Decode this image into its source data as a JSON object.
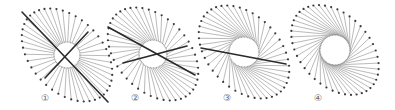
{
  "diagram": {
    "colors": {
      "spoke": "#8c8c8c",
      "dot": "#3a3a3a",
      "circle": "#9a9a9a",
      "thick_line": "#2a2a2a",
      "label": "#666666"
    },
    "figures": [
      {
        "label": "①",
        "label_pos": [
          45,
          98
        ],
        "center": [
          67,
          55
        ],
        "circle_r": 13,
        "ellipse": {
          "rx": 54,
          "ry": 36,
          "rotation_deg": 47
        },
        "spoke_count": 44,
        "twist_deg": 0,
        "thick_lines": [
          [
            [
              22,
              12
            ],
            [
              108,
              102
            ]
          ],
          [
            [
              45,
              78
            ],
            [
              88,
              32
            ]
          ]
        ]
      },
      {
        "label": "②",
        "label_pos": [
          135,
          98
        ],
        "center": [
          153,
          54
        ],
        "circle_r": 14,
        "ellipse": {
          "rx": 54,
          "ry": 36,
          "rotation_deg": 47
        },
        "spoke_count": 44,
        "twist_deg": 20,
        "thick_lines": [
          [
            [
              108,
              27
            ],
            [
              195,
              75
            ]
          ],
          [
            [
              123,
              63
            ],
            [
              187,
              46
            ]
          ]
        ]
      },
      {
        "label": "③",
        "label_pos": [
          227,
          98
        ],
        "center": [
          244,
          52
        ],
        "circle_r": 15,
        "ellipse": {
          "rx": 54,
          "ry": 36,
          "rotation_deg": 47
        },
        "spoke_count": 44,
        "twist_deg": 45,
        "thick_lines": [
          [
            [
              201,
              48
            ],
            [
              286,
              64
            ]
          ]
        ]
      },
      {
        "label": "④",
        "label_pos": [
          318,
          98
        ],
        "center": [
          335,
          50
        ],
        "circle_r": 15,
        "ellipse": {
          "rx": 52,
          "ry": 35,
          "rotation_deg": 47
        },
        "spoke_count": 44,
        "twist_deg": 75,
        "thick_lines": []
      }
    ]
  }
}
